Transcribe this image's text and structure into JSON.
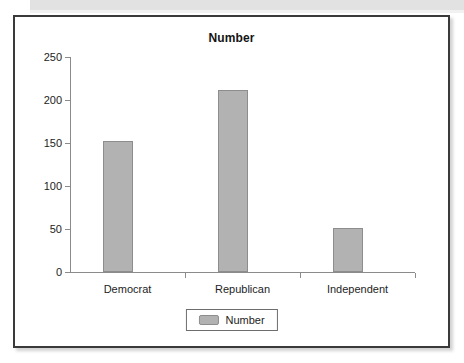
{
  "figure": {
    "title": "Number",
    "bar_color": "#b2b2b2",
    "bar_border_color": "#8d8d8d",
    "axis_color": "#8b8b8b",
    "frame_color": "#3a3a3a",
    "text_color": "#1d1d1d"
  },
  "legend": {
    "position": "bottom-center",
    "entries": [
      {
        "label": "Number",
        "swatch": "#b2b2b2"
      }
    ]
  },
  "chart_data": {
    "type": "bar",
    "title": "Number",
    "xlabel": "",
    "ylabel": "",
    "categories": [
      "Democrat",
      "Republican",
      "Independent"
    ],
    "values": [
      152,
      212,
      51
    ],
    "series": [
      {
        "name": "Number",
        "values": [
          152,
          212,
          51
        ]
      }
    ],
    "ylim": [
      0,
      250
    ],
    "yticks": [
      0,
      50,
      100,
      150,
      200,
      250
    ],
    "ytick_labels": [
      "0",
      "50",
      "100",
      "150",
      "200",
      "250"
    ],
    "grid": false,
    "legend": [
      "Number"
    ]
  }
}
